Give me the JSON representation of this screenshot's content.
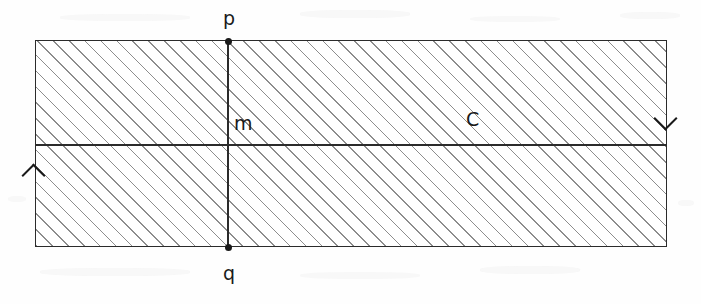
{
  "figure": {
    "type": "geometric-diagram",
    "canvas": {
      "width": 701,
      "height": 304
    },
    "background_color": "#fefefe",
    "ink_color": "#1a1a1a",
    "hatch_color": "#8d8d8d",
    "labels": {
      "top_vertex": "p",
      "bottom_vertex": "q",
      "midpoint": "m",
      "region": "C"
    },
    "shape": {
      "rect": {
        "x": 35,
        "y": 40,
        "width": 632,
        "height": 207
      },
      "vertical_line_x": 228,
      "horizontal_line_y": 145
    },
    "arrows": [
      {
        "name": "right-edge-down-arrow",
        "direction": "down",
        "x": 667,
        "y": 118
      },
      {
        "name": "left-edge-up-arrow",
        "direction": "up",
        "x": 35,
        "y": 175
      }
    ],
    "vertices": [
      {
        "name": "p",
        "x": 228,
        "y": 40
      },
      {
        "name": "q",
        "x": 228,
        "y": 247
      }
    ]
  }
}
